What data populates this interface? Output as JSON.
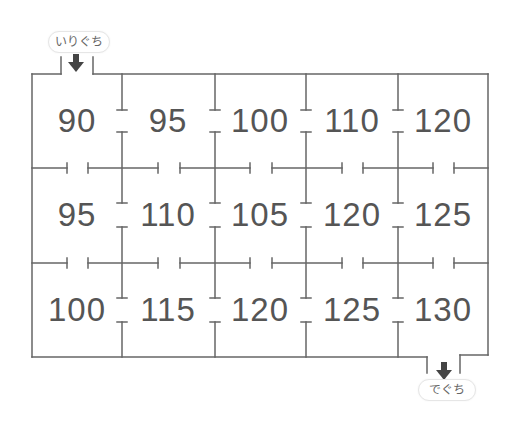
{
  "entrance": {
    "label": "いりぐち",
    "icon": "arrow-down-icon"
  },
  "exit": {
    "label": "でぐち",
    "icon": "arrow-down-icon"
  },
  "colors": {
    "wall": "#666666",
    "number": "#555555",
    "arrow": "#444444"
  },
  "grid": {
    "rows": [
      [
        "90",
        "95",
        "100",
        "110",
        "120"
      ],
      [
        "95",
        "110",
        "105",
        "120",
        "125"
      ],
      [
        "100",
        "115",
        "120",
        "125",
        "130"
      ]
    ]
  }
}
